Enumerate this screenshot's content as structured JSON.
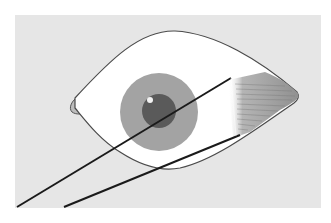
{
  "illustration": {
    "subject": "eye with brush applying eyeshadow at outer corner",
    "colors": {
      "background": "#ffffff",
      "panel": "#e6e6e6",
      "sclera": "#ffffff",
      "outline": "#4a4a4a",
      "iris": "#a3a3a3",
      "pupil": "#5a5a5a",
      "highlight": "#f2f2f2",
      "tear_duct": "#bdbdbd",
      "shadow_brush": "#9a9a9a",
      "lines": "#1a1a1a"
    }
  }
}
